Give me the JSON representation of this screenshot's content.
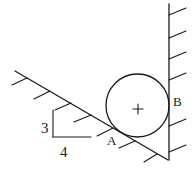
{
  "diagram": {
    "labels": {
      "contact_a": "A",
      "contact_b": "B",
      "slope_rise": "3",
      "slope_run": "4"
    },
    "center_marker": "+",
    "colors": {
      "stroke": "#1a1a1a",
      "background": "#ffffff"
    }
  }
}
